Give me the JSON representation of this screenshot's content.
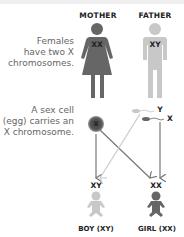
{
  "parents": {
    "mother": {
      "label": "MOTHER",
      "chromosomes": "XX",
      "color": "#666666"
    },
    "father": {
      "label": "FATHER",
      "chromosomes": "XY",
      "color": "#c8c8c8"
    }
  },
  "captions": {
    "females_line1": "Females",
    "females_line2": "have two X",
    "females_line3": "chromosomes.",
    "egg_line1": "A sex cell",
    "egg_line2": "(egg) carries an",
    "egg_line3": "X chromosome."
  },
  "cells": {
    "egg": "X",
    "sperm_y": "Y",
    "sperm_x": "X"
  },
  "children": {
    "boy": {
      "chromosomes": "XY",
      "label": "BOY (XY)",
      "color": "#c8c8c8"
    },
    "girl": {
      "chromosomes": "XX",
      "label": "GIRL (XX)",
      "color": "#666666"
    }
  },
  "colors": {
    "dark": "#666666",
    "light": "#c8c8c8",
    "arrow_dark": "#777777",
    "arrow_light": "#cccccc"
  }
}
